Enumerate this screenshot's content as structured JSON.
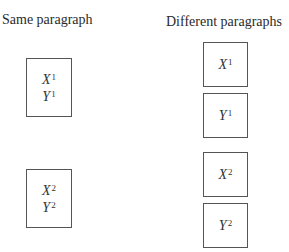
{
  "left": {
    "heading": "Same paragraph",
    "boxes": [
      {
        "lines": [
          {
            "var": "X",
            "sup": "1"
          },
          {
            "var": "Y",
            "sup": "1"
          }
        ]
      },
      {
        "lines": [
          {
            "var": "X",
            "sup": "2"
          },
          {
            "var": "Y",
            "sup": "2"
          }
        ]
      }
    ]
  },
  "right": {
    "heading": "Different paragraphs",
    "boxes": [
      {
        "var": "X",
        "sup": "1"
      },
      {
        "var": "Y",
        "sup": "1"
      },
      {
        "var": "X",
        "sup": "2"
      },
      {
        "var": "Y",
        "sup": "2"
      }
    ]
  }
}
